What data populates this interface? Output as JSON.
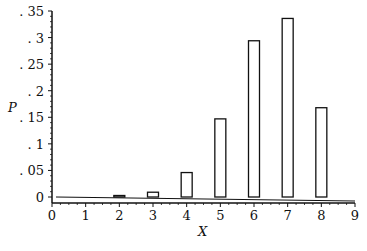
{
  "chart_data": {
    "type": "bar",
    "title": "",
    "xlabel": "X",
    "ylabel": "P",
    "x": [
      0,
      1,
      2,
      3,
      4,
      5,
      6,
      7,
      8
    ],
    "values": [
      0.0,
      0.0,
      0.001,
      0.009,
      0.046,
      0.147,
      0.294,
      0.336,
      0.168
    ],
    "xlim": [
      0,
      9
    ],
    "ylim": [
      0,
      0.35
    ],
    "xticks": [
      "0",
      "1",
      "2",
      "3",
      "4",
      "5",
      "6",
      "7",
      "8",
      "9"
    ],
    "yticks": [
      "0",
      ". 05",
      ". 1",
      ". 15",
      ". 2",
      ". 25",
      ". 3",
      ". 35"
    ],
    "grid": false,
    "legend": null,
    "bar_style": "outline"
  }
}
